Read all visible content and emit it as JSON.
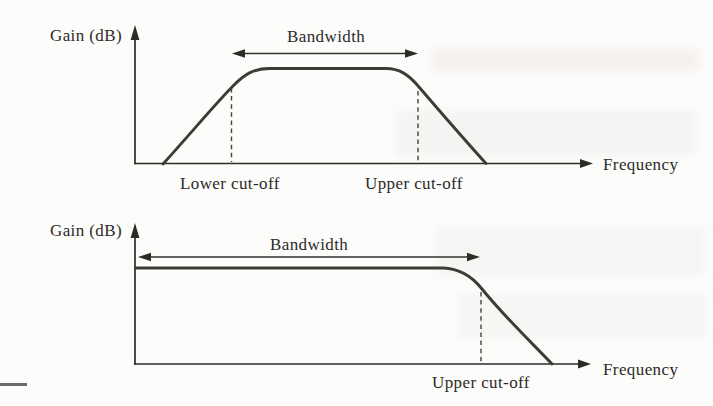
{
  "page": {
    "background_color": "#fcfcfb",
    "ink_color": "#2d2b28",
    "curve_color": "#3d3b38"
  },
  "figure_top": {
    "y_axis_label": "Gain (dB)",
    "x_axis_label": "Frequency",
    "bandwidth_label": "Bandwidth",
    "lower_cutoff_label": "Lower cut-off",
    "upper_cutoff_label": "Upper cut-off"
  },
  "figure_bottom": {
    "y_axis_label": "Gain (dB)",
    "x_axis_label": "Frequency",
    "bandwidth_label": "Bandwidth",
    "upper_cutoff_label": "Upper cut-off"
  }
}
